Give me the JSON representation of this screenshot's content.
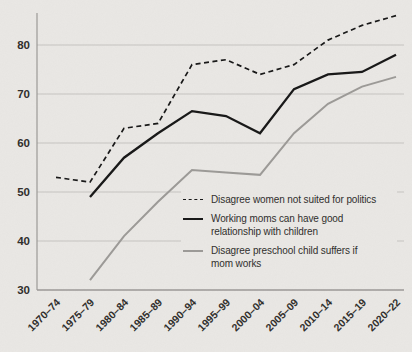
{
  "page": {
    "background_color": "#eae8e5",
    "gridline_color": "#c6c4c1",
    "axis_color": "#9b9996",
    "tick_text_color": "#2f2d2b"
  },
  "chart_data": {
    "type": "line",
    "categories": [
      "1970–74",
      "1975–79",
      "1980–84",
      "1985–89",
      "1990–94",
      "1995–99",
      "2000–04",
      "2005–09",
      "2010–14",
      "2015–19",
      "2020–22"
    ],
    "series": [
      {
        "name": "Disagree women not suited for politics",
        "style": "dashed",
        "color": "#161616",
        "values": [
          53,
          52,
          63,
          64,
          76,
          77,
          74,
          76,
          81,
          84,
          86
        ]
      },
      {
        "name": "Working moms can have good relationship with children",
        "style": "solid",
        "color": "#161616",
        "values": [
          null,
          49,
          57,
          62,
          66.5,
          65.5,
          62,
          71,
          74,
          74.5,
          78
        ]
      },
      {
        "name": "Disagree preschool child suffers if mom works",
        "style": "solid",
        "color": "#9c9a97",
        "values": [
          null,
          32,
          41,
          48,
          54.5,
          54,
          53.5,
          62,
          68,
          71.5,
          73.5
        ]
      }
    ],
    "title": "",
    "xlabel": "",
    "ylabel": "",
    "ylim": [
      30,
      87
    ],
    "yticks": [
      30,
      40,
      50,
      60,
      70,
      80
    ],
    "grid": "horizontal",
    "legend_position": "inside-right-middle"
  },
  "legend": {
    "items": [
      {
        "lines": [
          "Disagree women not suited for politics"
        ]
      },
      {
        "lines": [
          "Working moms can have good",
          "relationship with children"
        ]
      },
      {
        "lines": [
          "Disagree preschool child suffers if",
          "mom works"
        ]
      }
    ]
  }
}
